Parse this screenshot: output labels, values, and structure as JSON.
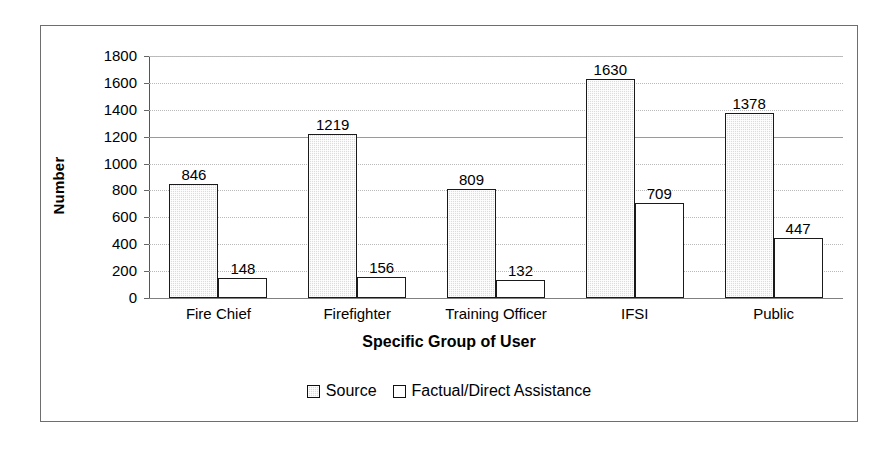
{
  "chart_data": {
    "type": "bar",
    "title": "",
    "xlabel": "Specific Group of User",
    "ylabel": "Number",
    "categories": [
      "Fire Chief",
      "Firefighter",
      "Training Officer",
      "IFSI",
      "Public"
    ],
    "series": [
      {
        "name": "Source",
        "values": [
          846,
          1219,
          809,
          1630,
          1378
        ],
        "fill": "#dcdcdc"
      },
      {
        "name": "Factual/Direct Assistance",
        "values": [
          148,
          156,
          132,
          709,
          447
        ],
        "fill": "#ffffff"
      }
    ],
    "ylim": [
      0,
      1800
    ],
    "ytick_labels": [
      "1800",
      "1600",
      "1400",
      "1200",
      "1000",
      "800",
      "600",
      "400",
      "200",
      "0"
    ],
    "ytick_values": [
      1800,
      1600,
      1400,
      1200,
      1000,
      800,
      600,
      400,
      200,
      0
    ],
    "grid": true,
    "legend_position": "bottom",
    "data_labels": true
  },
  "legend": {
    "items": [
      {
        "label": "Source",
        "swatch": "gray-square-swatch"
      },
      {
        "label": "Factual/Direct Assistance",
        "swatch": "white-square-swatch"
      }
    ]
  }
}
